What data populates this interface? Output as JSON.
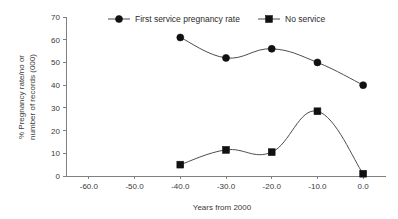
{
  "chart_data": {
    "type": "line",
    "title": "",
    "xlabel": "Years from 2000",
    "ylabel": "% Pregnancy rate/no or number of records (000)",
    "ylabel_lines": [
      "% Pregnancy rate/no or",
      "number of records (000)"
    ],
    "xlim": [
      -65,
      5
    ],
    "ylim": [
      0,
      70
    ],
    "xticks": [
      -60,
      -50,
      -40,
      -30,
      -20,
      -10,
      0
    ],
    "xtick_labels": [
      "-60.0",
      "-50.0",
      "-40.0",
      "-30.0",
      "-20.0",
      "-10.0",
      "0.0"
    ],
    "yticks": [
      0,
      10,
      20,
      30,
      40,
      50,
      60,
      70
    ],
    "ytick_labels": [
      "0",
      "10",
      "20",
      "30",
      "40",
      "50",
      "60",
      "70"
    ],
    "grid": false,
    "legend_position": "top",
    "series": [
      {
        "name": "First service pregnancy rate",
        "marker": "circle",
        "color": "#111111",
        "x": [
          -40,
          -30,
          -20,
          -10,
          0
        ],
        "values": [
          61,
          52,
          56,
          50,
          40
        ]
      },
      {
        "name": "No service",
        "marker": "square",
        "color": "#111111",
        "x": [
          -40,
          -30,
          -20,
          -10,
          0
        ],
        "values": [
          5,
          11.5,
          10.5,
          28.5,
          1
        ]
      }
    ]
  }
}
